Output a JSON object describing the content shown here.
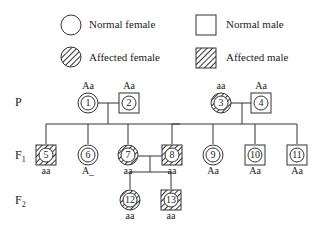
{
  "legend": {
    "normal_female": "Normal female",
    "normal_male": "Normal male",
    "affected_female": "Affected female",
    "affected_male": "Affected male"
  },
  "generations": {
    "p": "P",
    "f1": "F",
    "f1_sub": "1",
    "f2": "F",
    "f2_sub": "2"
  },
  "individuals": [
    {
      "id": "1",
      "sex": "female",
      "affected": false,
      "genotype": "Aa"
    },
    {
      "id": "2",
      "sex": "male",
      "affected": false,
      "genotype": "Aa"
    },
    {
      "id": "3",
      "sex": "female",
      "affected": true,
      "genotype": "aa"
    },
    {
      "id": "4",
      "sex": "male",
      "affected": false,
      "genotype": "Aa"
    },
    {
      "id": "5",
      "sex": "male",
      "affected": true,
      "genotype": "aa"
    },
    {
      "id": "6",
      "sex": "female",
      "affected": false,
      "genotype": "A_"
    },
    {
      "id": "7",
      "sex": "female",
      "affected": true,
      "genotype": "aa"
    },
    {
      "id": "8",
      "sex": "male",
      "affected": true,
      "genotype": "aa"
    },
    {
      "id": "9",
      "sex": "female",
      "affected": false,
      "genotype": "Aa"
    },
    {
      "id": "10",
      "sex": "male",
      "affected": false,
      "genotype": "Aa"
    },
    {
      "id": "11",
      "sex": "male",
      "affected": false,
      "genotype": "Aa"
    },
    {
      "id": "12",
      "sex": "female",
      "affected": true,
      "genotype": "aa"
    },
    {
      "id": "13",
      "sex": "male",
      "affected": true,
      "genotype": "aa"
    }
  ]
}
